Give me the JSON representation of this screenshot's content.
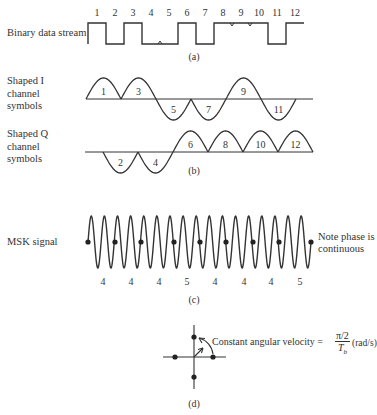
{
  "panel_a": {
    "label": "Binary data stream",
    "caption": "(a)",
    "bit_numbers": [
      "1",
      "2",
      "3",
      "4",
      "5",
      "6",
      "7",
      "8",
      "9",
      "10",
      "11",
      "12"
    ],
    "bits": [
      1,
      0,
      1,
      0,
      0,
      1,
      0,
      1,
      1,
      1,
      0,
      1
    ]
  },
  "panel_b": {
    "i_label": "Shaped I\nchannel\nsymbols",
    "i_label_lines": [
      "Shaped I",
      "channel",
      "symbols"
    ],
    "q_label_lines": [
      "Shaped Q",
      "channel",
      "symbols"
    ],
    "caption": "(b)",
    "i_symbols": [
      {
        "n": "1",
        "polarity": "up"
      },
      {
        "n": "3",
        "polarity": "up"
      },
      {
        "n": "5",
        "polarity": "down"
      },
      {
        "n": "7",
        "polarity": "down"
      },
      {
        "n": "9",
        "polarity": "up"
      },
      {
        "n": "11",
        "polarity": "down"
      }
    ],
    "q_symbols": [
      {
        "n": "2",
        "polarity": "down"
      },
      {
        "n": "4",
        "polarity": "down"
      },
      {
        "n": "6",
        "polarity": "up"
      },
      {
        "n": "8",
        "polarity": "up"
      },
      {
        "n": "10",
        "polarity": "up"
      },
      {
        "n": "12",
        "polarity": "up"
      }
    ]
  },
  "panel_c": {
    "label": "MSK signal",
    "note_lines": [
      "Note phase is",
      "continuous"
    ],
    "cycle_counts": [
      "4",
      "4",
      "4",
      "5",
      "4",
      "4",
      "4",
      "5"
    ],
    "caption": "(c)"
  },
  "panel_d": {
    "annotation": "Constant angular velocity =",
    "fraction_numerator": "π/2",
    "fraction_denominator": "T",
    "fraction_denominator_sub": "b",
    "units": "(rad/s)",
    "caption": "(d)"
  }
}
